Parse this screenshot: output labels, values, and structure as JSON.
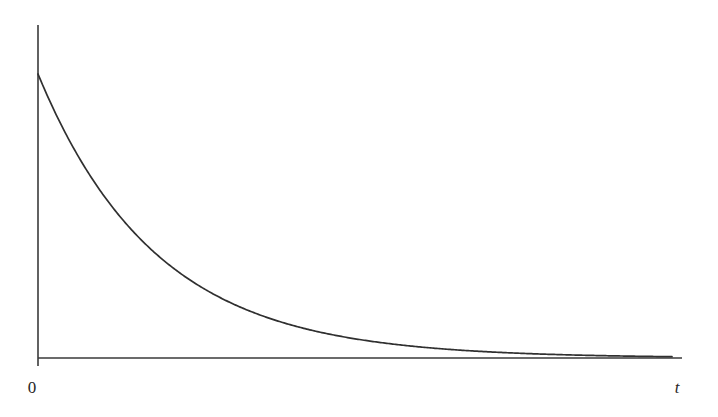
{
  "figure": {
    "background_color": "#ffffff",
    "stroke_color": "#303030",
    "axis_color": "#3a3a3a",
    "width": 718,
    "height": 417,
    "origin_label": "0",
    "x_axis_label": "t",
    "y_axis_label": ""
  },
  "chart_data": {
    "type": "line",
    "title": "",
    "subtitle": "",
    "xlabel": "t",
    "ylabel": "",
    "grid": false,
    "legend": null,
    "annotations": [],
    "axes": {
      "x_origin_px": 38,
      "y_origin_px": 358,
      "x_axis_end_px": 682,
      "y_axis_top_px": 25,
      "y_axis_stub_below_px": 366,
      "xlim": [
        0,
        1
      ],
      "ylim": [
        0,
        1
      ],
      "x_ticks": [
        0
      ],
      "x_tick_labels": [
        "0"
      ],
      "y_ticks": [],
      "y_tick_labels": []
    },
    "curve": {
      "name": "exponential decay",
      "form": "y = A * exp(-k * t)",
      "amplitude_px": 284,
      "decay_rate_per_px": 0.0085,
      "start_px": [
        38,
        74
      ],
      "end_px": [
        672,
        357
      ],
      "x": [
        0.0,
        0.039,
        0.078,
        0.117,
        0.156,
        0.194,
        0.233,
        0.272,
        0.311,
        0.35,
        0.389,
        0.428,
        0.466,
        0.505,
        0.544,
        0.583,
        0.622,
        0.661,
        0.7,
        0.739,
        0.777,
        0.816,
        0.855,
        0.894,
        0.933,
        0.972,
        1.0
      ],
      "y": [
        1.0,
        0.802,
        0.644,
        0.516,
        0.414,
        0.333,
        0.267,
        0.214,
        0.172,
        0.138,
        0.111,
        0.089,
        0.071,
        0.057,
        0.046,
        0.037,
        0.029,
        0.024,
        0.019,
        0.015,
        0.012,
        0.01,
        0.008,
        0.006,
        0.005,
        0.004,
        0.003
      ],
      "points_px": [
        [
          38,
          74
        ],
        [
          63,
          130
        ],
        [
          88,
          175
        ],
        [
          113,
          212
        ],
        [
          138,
          241
        ],
        [
          163,
          264
        ],
        [
          188,
          283
        ],
        [
          213,
          297
        ],
        [
          238,
          309
        ],
        [
          263,
          319
        ],
        [
          288,
          326
        ],
        [
          313,
          332
        ],
        [
          338,
          337
        ],
        [
          363,
          341
        ],
        [
          388,
          345
        ],
        [
          413,
          347
        ],
        [
          438,
          350
        ],
        [
          463,
          351
        ],
        [
          488,
          353
        ],
        [
          513,
          354
        ],
        [
          538,
          355
        ],
        [
          563,
          355
        ],
        [
          588,
          356
        ],
        [
          613,
          356
        ],
        [
          638,
          357
        ],
        [
          663,
          357
        ],
        [
          672,
          357
        ]
      ]
    }
  },
  "labels": {
    "origin": {
      "text": "0",
      "x_px": 32,
      "y_px": 393,
      "italic": false
    },
    "t_axis": {
      "text": "t",
      "x_px": 677,
      "y_px": 393,
      "italic": true
    }
  }
}
